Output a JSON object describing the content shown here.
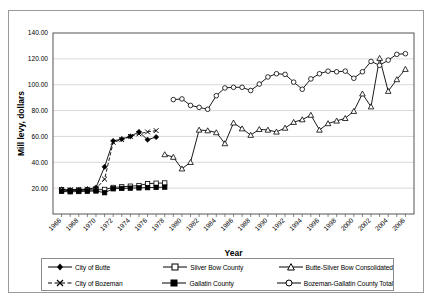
{
  "axes": {
    "ylabel": "Mill levy, dollars",
    "xlabel": "Year",
    "ytick_labels": [
      "140.00",
      "120.00",
      "100.00",
      "80.00",
      "60.00",
      "40.00",
      "20.00"
    ],
    "xtick_labels": [
      "1966",
      "1968",
      "1970",
      "1972",
      "1974",
      "1976",
      "1978",
      "1980",
      "1982",
      "1984",
      "1986",
      "1988",
      "1990",
      "1992",
      "1994",
      "1996",
      "1998",
      "2000",
      "2002",
      "2004",
      "2006"
    ]
  },
  "legend": {
    "items": [
      {
        "label": "City of Butte",
        "marker": "filled-diamond",
        "line": "solid"
      },
      {
        "label": "Silver Bow County",
        "marker": "open-square",
        "line": "solid"
      },
      {
        "label": "Butte-Silver Bow Consolidated",
        "marker": "open-triangle",
        "line": "solid"
      },
      {
        "label": "City of Bozeman",
        "marker": "x-cross",
        "line": "dashed"
      },
      {
        "label": "Gallatin County",
        "marker": "filled-square",
        "line": "solid"
      },
      {
        "label": "Bozeman-Gallatin County Total",
        "marker": "open-circle",
        "line": "solid"
      }
    ]
  },
  "chart_data": {
    "type": "line",
    "title": "",
    "xlabel": "Year",
    "ylabel": "Mill levy, dollars",
    "xlim": [
      1965,
      2007
    ],
    "ylim": [
      0,
      140
    ],
    "ytick_step": 20,
    "grid": "horizontal",
    "legend_position": "bottom",
    "series": [
      {
        "name": "City of Butte",
        "marker": "filled-diamond",
        "x": [
          1966,
          1967,
          1968,
          1969,
          1970,
          1971,
          1972,
          1973,
          1974,
          1975,
          1976,
          1977
        ],
        "y": [
          19.0,
          18.6,
          18.8,
          19.2,
          20.5,
          36.5,
          56.5,
          58.0,
          60.0,
          63.5,
          57.5,
          59.5
        ]
      },
      {
        "name": "Silver Bow County",
        "marker": "open-square",
        "x": [
          1966,
          1967,
          1968,
          1969,
          1970,
          1971,
          1972,
          1973,
          1974,
          1975,
          1976,
          1977,
          1978
        ],
        "y": [
          18.5,
          18.0,
          18.2,
          18.4,
          18.6,
          19.0,
          20.5,
          21.0,
          21.5,
          22.0,
          23.5,
          23.8,
          24.0
        ]
      },
      {
        "name": "Butte-Silver Bow Consolidated",
        "marker": "open-triangle",
        "x": [
          1978,
          1979,
          1980,
          1981,
          1982,
          1983,
          1984,
          1985,
          1986,
          1987,
          1988,
          1989,
          1990,
          1991,
          1992,
          1993,
          1994,
          1995,
          1996,
          1997,
          1998,
          1999,
          2000,
          2001,
          2002,
          2003,
          2004,
          2005,
          2006
        ],
        "y": [
          46.0,
          44.0,
          35.0,
          40.0,
          65.0,
          64.5,
          63.0,
          54.5,
          70.5,
          66.0,
          61.0,
          65.5,
          65.0,
          63.5,
          66.5,
          71.0,
          73.0,
          76.5,
          65.0,
          70.0,
          72.0,
          74.0,
          79.5,
          93.0,
          83.0,
          120.5,
          95.0,
          104.0,
          112.0
        ]
      },
      {
        "name": "City of Bozeman",
        "marker": "x-cross",
        "x": [
          1966,
          1967,
          1968,
          1969,
          1970,
          1971,
          1972,
          1973,
          1974,
          1975,
          1976,
          1977
        ],
        "y": [
          19.0,
          18.8,
          19.0,
          19.2,
          19.5,
          27.0,
          55.5,
          57.5,
          60.0,
          62.0,
          63.5,
          64.5
        ]
      },
      {
        "name": "Gallatin County",
        "marker": "filled-square",
        "x": [
          1966,
          1967,
          1968,
          1969,
          1970,
          1971,
          1972,
          1973,
          1974,
          1975,
          1976,
          1977,
          1978
        ],
        "y": [
          17.5,
          17.2,
          17.4,
          17.6,
          17.8,
          16.5,
          19.5,
          19.8,
          20.0,
          20.2,
          20.4,
          20.6,
          20.8
        ]
      },
      {
        "name": "Bozeman-Gallatin County Total",
        "marker": "open-circle",
        "x": [
          1979,
          1980,
          1981,
          1982,
          1983,
          1984,
          1985,
          1986,
          1987,
          1988,
          1989,
          1990,
          1991,
          1992,
          1993,
          1994,
          1995,
          1996,
          1997,
          1998,
          1999,
          2000,
          2001,
          2002,
          2003,
          2004,
          2005,
          2006
        ],
        "y": [
          88.5,
          89.0,
          84.0,
          82.5,
          81.0,
          91.5,
          97.5,
          98.0,
          98.0,
          95.5,
          100.5,
          106.0,
          108.5,
          108.0,
          102.0,
          96.5,
          104.5,
          108.5,
          110.5,
          110.0,
          110.5,
          105.0,
          110.0,
          118.0,
          115.0,
          119.0,
          123.5,
          124.0
        ]
      }
    ]
  }
}
